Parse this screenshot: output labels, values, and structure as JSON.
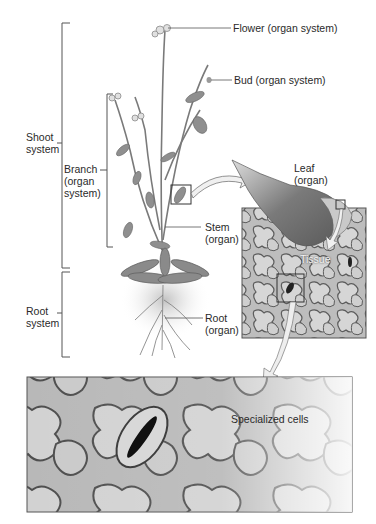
{
  "diagram": {
    "labels": {
      "flower": "Flower (organ system)",
      "bud": "Bud (organ system)",
      "shoot_line1": "Shoot",
      "shoot_line2": "system",
      "branch_line1": "Branch",
      "branch_line2": "(organ",
      "branch_line3": "system)",
      "leaf_line1": "Leaf",
      "leaf_line2": "(organ)",
      "stem_line1": "Stem",
      "stem_line2": "(organ)",
      "tissue": "Tissue",
      "root_line1": "Root",
      "root_line2": "system",
      "root_organ_line1": "Root",
      "root_organ_line2": "(organ)",
      "specialized": "Specialized cells"
    },
    "colors": {
      "line": "#555555",
      "plant": "#8a8a8a",
      "leaf_dark": "#6e6e6e",
      "cell_fill": "#c8c8c8",
      "cell_border": "#5a5a5a",
      "text": "#2a2a2a"
    }
  }
}
